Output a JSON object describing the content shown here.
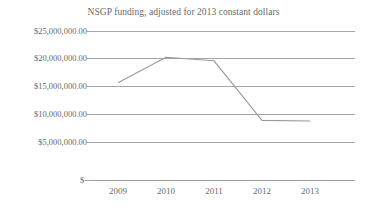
{
  "chart_data": {
    "type": "line",
    "title": "NSGP funding, adjusted for 2013 constant dollars",
    "xlabel": "",
    "ylabel": "",
    "categories": [
      "2009",
      "2010",
      "2011",
      "2012",
      "2013"
    ],
    "series": [
      {
        "name": "NSGP funding",
        "values": [
          16300000,
          20600000,
          20000000,
          10000000,
          9900000
        ],
        "color": "#9a9a9a"
      }
    ],
    "ylim": [
      0,
      25000000
    ],
    "ytick_values": [
      0,
      5000000,
      10000000,
      15000000,
      20000000,
      25000000
    ],
    "ytick_labels": [
      "$-",
      "$5,000,000.00",
      "$10,000,000.00",
      "$15,000,000.00",
      "$20,000,000.00",
      "$25,000,000.00"
    ],
    "grid": true,
    "grid_axis": "y",
    "legend": false,
    "legend_position": "none",
    "markers": false,
    "annotations": []
  },
  "colors": {
    "background": "#ffffff",
    "gridline": "#a6a6a6",
    "axis_text": "#6a6a6a",
    "title_text": "#6a6a6a",
    "series_line": "#9a9a9a"
  }
}
